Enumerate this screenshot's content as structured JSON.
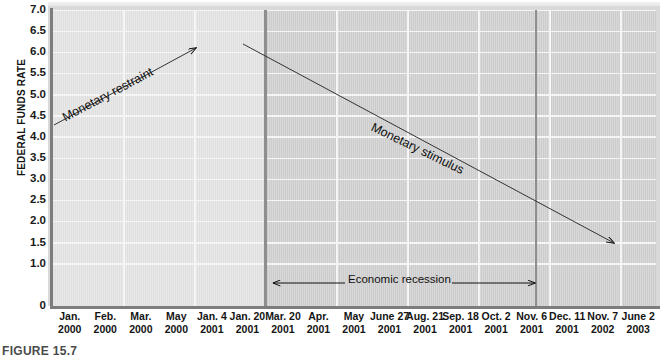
{
  "figure": {
    "caption": "FIGURE 15.7"
  },
  "chart_data": {
    "type": "line",
    "line_style": "step",
    "title": "",
    "xlabel": "",
    "ylabel": "FEDERAL FUNDS RATE",
    "ylim": [
      0,
      7.0
    ],
    "grid": true,
    "legend": "none",
    "ytick_labels": [
      "7.0",
      "6.5",
      "6.0",
      "5.5",
      "5.0",
      "4.5",
      "4.0",
      "3.5",
      "3.0",
      "2.5",
      "2.0",
      "1.5",
      "1.0",
      "0"
    ],
    "ytick_values": [
      7.0,
      6.5,
      6.0,
      5.5,
      5.0,
      4.5,
      4.0,
      3.5,
      3.0,
      2.5,
      2.0,
      1.5,
      1.0,
      0
    ],
    "categories": [
      "Jan. 2000",
      "Feb. 2000",
      "Mar. 2000",
      "May 2000",
      "Jan. 4 2001",
      "Jan. 20 2001",
      "Mar. 20 2001",
      "Apr. 2001",
      "May 2001",
      "June 27 2001",
      "Aug. 21 2001",
      "Sep. 18 2001",
      "Oct. 2 2001",
      "Nov. 6 2001",
      "Dec. 11 2001",
      "Nov. 7 2002",
      "June 2 2003"
    ],
    "xtick_labels": [
      {
        "line1": "Jan.",
        "line2": "2000"
      },
      {
        "line1": "Feb.",
        "line2": "2000"
      },
      {
        "line1": "Mar.",
        "line2": "2000"
      },
      {
        "line1": "May",
        "line2": "2000"
      },
      {
        "line1": "Jan. 4",
        "line2": "2001"
      },
      {
        "line1": "Jan. 20",
        "line2": "2001"
      },
      {
        "line1": "Mar. 20",
        "line2": "2001"
      },
      {
        "line1": "Apr.",
        "line2": "2001"
      },
      {
        "line1": "May",
        "line2": "2001"
      },
      {
        "line1": "June 27",
        "line2": "2001"
      },
      {
        "line1": "Aug. 21",
        "line2": "2001"
      },
      {
        "line1": "Sep. 18",
        "line2": "2001"
      },
      {
        "line1": "Oct. 2",
        "line2": "2001"
      },
      {
        "line1": "Nov. 6",
        "line2": "2001"
      },
      {
        "line1": "Dec. 11",
        "line2": "2001"
      },
      {
        "line1": "Nov. 7",
        "line2": "2002"
      },
      {
        "line1": "June 2",
        "line2": "2003"
      }
    ],
    "values": [
      5.5,
      5.75,
      6.0,
      6.5,
      6.0,
      5.5,
      5.0,
      4.5,
      4.0,
      3.75,
      3.5,
      3.0,
      2.5,
      2.0,
      1.75,
      1.25,
      1.0
    ],
    "series": [
      {
        "name": "Federal funds rate",
        "values": [
          5.5,
          5.75,
          6.0,
          6.5,
          6.0,
          5.5,
          5.0,
          4.5,
          4.0,
          3.75,
          3.5,
          3.0,
          2.5,
          2.0,
          1.75,
          1.25,
          1.0
        ]
      }
    ],
    "annotations": [
      {
        "name": "monetary-restraint",
        "text": "Monetary restraint",
        "direction": "up-right"
      },
      {
        "name": "monetary-stimulus",
        "text": "Monetary stimulus",
        "direction": "down-right"
      },
      {
        "name": "economic-recession",
        "text": "Economic recession",
        "direction": "double-arrow"
      }
    ],
    "shaded_regions": [
      {
        "name": "recession",
        "from": "Mar. 20 2001",
        "to": "Nov. 6 2001",
        "color": "#cfcfcf"
      }
    ],
    "colors": {
      "step_line": "#8a8a8a",
      "band_pre": "#e3e3e3",
      "band_recession": "#cfcfcf",
      "gridline": "#f6f6f6",
      "axis": "#7d7d7d",
      "annotation": "#101010"
    }
  }
}
